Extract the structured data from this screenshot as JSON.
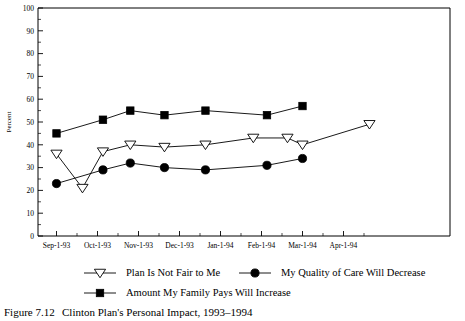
{
  "figure": {
    "caption_number": "Figure 7.12",
    "caption_title": "Clinton Plan's Personal Impact, 1993–1994"
  },
  "chart_data": {
    "type": "line",
    "title": "",
    "xlabel": "",
    "ylabel": "Percent",
    "ylim": [
      0,
      100
    ],
    "ytick_step": 10,
    "yminor_step": 5,
    "grid": false,
    "legend_position": "bottom",
    "ytick_labels": [
      "0",
      "10",
      "20",
      "30",
      "40",
      "50",
      "60",
      "70",
      "80",
      "90",
      "100"
    ],
    "xtick_labels": [
      "Sep-1-93",
      "Oct-1-93",
      "Nov-1-93",
      "Dec-1-93",
      "Jan-1-94",
      "Feb-1-94",
      "Mar-1-94",
      "Apr-1-94"
    ],
    "x_axis_note": "major tick per month label, minor tick at mid-month",
    "series": [
      {
        "name": "Plan Is Not Fair to Me",
        "marker": "open-down-triangle",
        "color": "#000000",
        "points": [
          {
            "x": "Sep-1-93",
            "value": 36
          },
          {
            "x": "Sep-20-93",
            "value": 21
          },
          {
            "x": "Oct-5-93",
            "value": 37
          },
          {
            "x": "Oct-25-93",
            "value": 40
          },
          {
            "x": "Nov-20-93",
            "value": 39
          },
          {
            "x": "Dec-20-93",
            "value": 40
          },
          {
            "x": "Jan-25-94",
            "value": 43
          },
          {
            "x": "Feb-20-94",
            "value": 43
          },
          {
            "x": "Mar-1-94",
            "value": 40
          },
          {
            "x": "Apr-20-94",
            "value": 49
          }
        ]
      },
      {
        "name": "My Quality of Care Will Decrease",
        "marker": "filled-circle",
        "color": "#000000",
        "points": [
          {
            "x": "Sep-1-93",
            "value": 23
          },
          {
            "x": "Oct-5-93",
            "value": 29
          },
          {
            "x": "Oct-25-93",
            "value": 32
          },
          {
            "x": "Nov-20-93",
            "value": 30
          },
          {
            "x": "Dec-20-93",
            "value": 29
          },
          {
            "x": "Feb-5-94",
            "value": 31
          },
          {
            "x": "Mar-1-94",
            "value": 34
          }
        ]
      },
      {
        "name": "Amount My Family Pays Will Increase",
        "marker": "filled-square",
        "color": "#000000",
        "points": [
          {
            "x": "Sep-1-93",
            "value": 45
          },
          {
            "x": "Oct-5-93",
            "value": 51
          },
          {
            "x": "Oct-25-93",
            "value": 55
          },
          {
            "x": "Nov-20-93",
            "value": 53
          },
          {
            "x": "Dec-20-93",
            "value": 55
          },
          {
            "x": "Feb-5-94",
            "value": 53
          },
          {
            "x": "Mar-1-94",
            "value": 57
          }
        ]
      }
    ]
  },
  "legend": {
    "items": [
      {
        "label": "Plan Is Not Fair to Me",
        "marker": "open-down-triangle"
      },
      {
        "label": "My Quality of Care Will Decrease",
        "marker": "filled-circle"
      },
      {
        "label": "Amount My Family Pays Will Increase",
        "marker": "filled-square"
      }
    ]
  }
}
